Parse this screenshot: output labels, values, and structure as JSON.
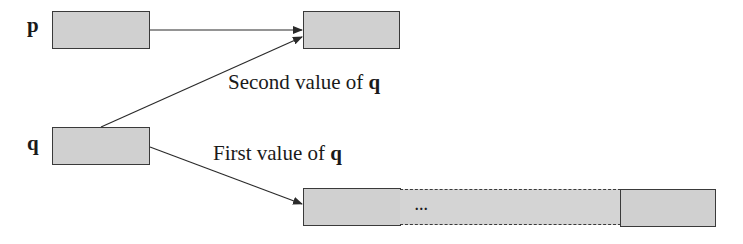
{
  "diagram": {
    "type": "pointer-reassignment",
    "variables": [
      {
        "name": "p",
        "label": "p"
      },
      {
        "name": "q",
        "label": "q"
      }
    ],
    "captions": {
      "second": {
        "text": "Second value of ",
        "var": "q"
      },
      "first": {
        "text": "First value of ",
        "var": "q"
      }
    },
    "array": {
      "ellipsis": "..."
    },
    "edges": [
      {
        "from": "p",
        "to": "single-target",
        "label": ""
      },
      {
        "from": "q",
        "to": "single-target",
        "label": "Second value of q"
      },
      {
        "from": "q",
        "to": "array-target",
        "label": "First value of q"
      }
    ],
    "colors": {
      "box_fill": "#d0d0d0",
      "box_border": "#3a3a3a",
      "line": "#2a2a2a",
      "background": "#ffffff"
    }
  }
}
